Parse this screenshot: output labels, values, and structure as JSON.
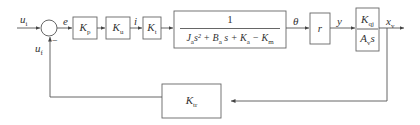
{
  "signals": {
    "input": "u",
    "input_sub": "i",
    "feedback": "u",
    "feedback_sub": "f",
    "error": "e",
    "current": "i",
    "angle": "θ",
    "displacement": "y",
    "output": "x",
    "output_sub": "v",
    "minus_sign": "−"
  },
  "blocks": {
    "kp": {
      "main": "K",
      "sub": "p"
    },
    "ku": {
      "main": "K",
      "sub": "u"
    },
    "kt": {
      "main": "K",
      "sub": "t"
    },
    "plant": {
      "numerator": "1",
      "den_terms": [
        {
          "main": "J",
          "sub": "a",
          "tail": "s² + "
        },
        {
          "main": "B",
          "sub": "a",
          "tail": " s + "
        },
        {
          "main": "K",
          "sub": "a",
          "tail": " − "
        },
        {
          "main": "K",
          "sub": "m",
          "tail": ""
        }
      ]
    },
    "r": {
      "main": "r"
    },
    "valve": {
      "num_main": "K",
      "num_sub": "qj",
      "den_main": "A",
      "den_sub": "v",
      "den_tail": "s"
    },
    "ktr": {
      "main": "K",
      "sub": "tr"
    }
  }
}
